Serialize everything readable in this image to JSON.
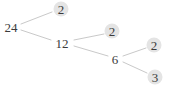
{
  "diagram": {
    "kind": "factor-tree",
    "root": "24",
    "nodes": [
      {
        "label": "24",
        "type": "composite"
      },
      {
        "label": "2",
        "type": "prime"
      },
      {
        "label": "12",
        "type": "composite"
      },
      {
        "label": "2",
        "type": "prime"
      },
      {
        "label": "6",
        "type": "composite"
      },
      {
        "label": "2",
        "type": "prime"
      },
      {
        "label": "3",
        "type": "prime"
      }
    ],
    "edges": [
      {
        "from": "24",
        "to": "2"
      },
      {
        "from": "24",
        "to": "12"
      },
      {
        "from": "12",
        "to": "2"
      },
      {
        "from": "12",
        "to": "6"
      },
      {
        "from": "6",
        "to": "2"
      },
      {
        "from": "6",
        "to": "3"
      }
    ],
    "colors": {
      "line": "#c9c9c9",
      "prime_bg": "#e4e4e4",
      "text": "#3b3b3b",
      "background": "#ffffff"
    }
  }
}
